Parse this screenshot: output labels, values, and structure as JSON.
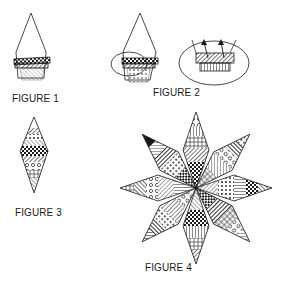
{
  "figures": [
    {
      "id": "figure-1",
      "label": "FIGURE 1",
      "description": "Diamond template with first fabric strips sewn at bottom"
    },
    {
      "id": "figure-2",
      "label": "FIGURE 2",
      "description": "Strips circled, with enlarged detail showing pressing direction arrows"
    },
    {
      "id": "figure-3",
      "label": "FIGURE 3",
      "description": "Completed pieced diamond"
    },
    {
      "id": "figure-4",
      "label": "FIGURE 4",
      "description": "Eight-pointed star assembled from pieced diamonds"
    }
  ],
  "colors": {
    "ink": "#1a1a1a",
    "background": "#ffffff"
  }
}
